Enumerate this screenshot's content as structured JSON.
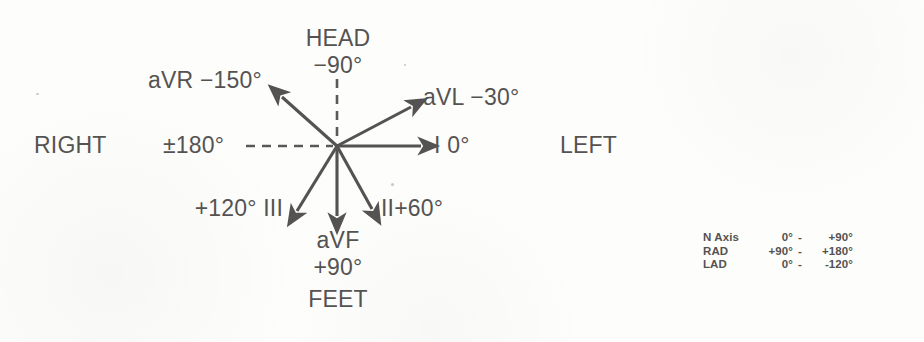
{
  "diagram": {
    "ink_color": "#555352",
    "origin": {
      "x": 337,
      "y": 146
    },
    "orientation_labels": {
      "head": "HEAD",
      "feet": "FEET",
      "right": "RIGHT",
      "left": "LEFT"
    },
    "axis_degrees": {
      "head": "−90°",
      "feet": "+90°",
      "right": "±180°"
    },
    "leads": [
      {
        "id": "aVR",
        "label": "aVR −150°",
        "name": "aVR",
        "degrees": "−150°",
        "style": "solid"
      },
      {
        "id": "aVL",
        "label": "aVL −30°",
        "name": "aVL",
        "degrees": "−30°",
        "style": "solid"
      },
      {
        "id": "I",
        "label": "I 0°",
        "name": "I",
        "degrees": "0°",
        "style": "solid"
      },
      {
        "id": "II",
        "label": "II+60°",
        "name": "II",
        "degrees": "+60°",
        "style": "solid"
      },
      {
        "id": "aVF",
        "label": "aVF",
        "name": "aVF",
        "degrees": "+90°",
        "style": "solid"
      },
      {
        "id": "III",
        "label": "+120° III",
        "name": "III",
        "degrees": "+120°",
        "style": "solid"
      }
    ],
    "reference_lines": [
      {
        "id": "horizontal-180",
        "style": "dashed",
        "degrees": "±180°"
      },
      {
        "id": "vertical-minus90",
        "style": "dashed",
        "degrees": "−90°"
      }
    ]
  },
  "legend": {
    "rows": [
      {
        "term": "N Axis",
        "from": "0°",
        "dash": "-",
        "to": "+90°"
      },
      {
        "term": "RAD",
        "from": "+90°",
        "dash": "-",
        "to": "+180°"
      },
      {
        "term": "LAD",
        "from": "0°",
        "dash": "-",
        "to": "-120°"
      }
    ]
  }
}
